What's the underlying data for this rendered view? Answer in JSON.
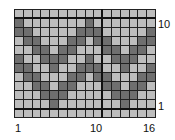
{
  "chart": {
    "columns": 16,
    "rows": 12,
    "colors": {
      "light": "#bdbdbd",
      "dark": "#6f6f6f",
      "grid": "#222222"
    },
    "row_labels": {
      "top": "10",
      "bottom": "1"
    },
    "column_labels": {
      "left": "1",
      "middle": "10",
      "right": "16"
    },
    "rows_top_to_bottom": [
      {
        "row": 11,
        "dark_cols": []
      },
      {
        "row": 10,
        "dark_cols": [
          1,
          9
        ]
      },
      {
        "row": 9,
        "dark_cols": [
          1,
          2,
          8,
          9,
          10,
          16
        ]
      },
      {
        "row": 8,
        "dark_cols": [
          2,
          3,
          7,
          8,
          10,
          11,
          15,
          16
        ]
      },
      {
        "row": 7,
        "dark_cols": [
          3,
          4,
          6,
          7,
          11,
          12,
          14,
          15
        ]
      },
      {
        "row": 6,
        "dark_cols": [
          1,
          4,
          5,
          6,
          9,
          12,
          13,
          14
        ]
      },
      {
        "row": 5,
        "dark_cols": [
          1,
          2,
          5,
          8,
          9,
          10,
          13,
          16
        ]
      },
      {
        "row": 4,
        "dark_cols": [
          2,
          3,
          7,
          8,
          10,
          11,
          15,
          16
        ]
      },
      {
        "row": 3,
        "dark_cols": [
          3,
          4,
          6,
          7,
          11,
          12,
          14,
          15
        ]
      },
      {
        "row": 2,
        "dark_cols": [
          4,
          5,
          6,
          12,
          13,
          14
        ]
      },
      {
        "row": 1,
        "dark_cols": [
          5,
          13
        ]
      },
      {
        "row": 0,
        "dark_cols": []
      }
    ]
  }
}
